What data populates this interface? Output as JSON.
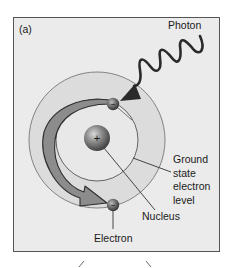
{
  "figure": {
    "panel_label": "(a)",
    "labels": {
      "photon": "Photon",
      "ground_state_line1": "Ground",
      "ground_state_line2": "state",
      "ground_state_line3": "electron",
      "ground_state_line4": "level",
      "nucleus": "Nucleus",
      "electron": "Electron"
    },
    "nucleus_symbol": "+",
    "electron_symbol": "−",
    "colors": {
      "frame_background": "#ebebeb",
      "frame_border": "#555555",
      "outer_ring_fill": "#dcdcdc",
      "inner_area_fill": "#e6e6e6",
      "arrow_fill": "#8c8c8c",
      "line": "#333333",
      "photon_wave": "#2a2a2a"
    }
  }
}
